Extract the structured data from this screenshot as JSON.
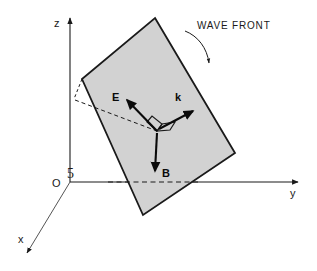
{
  "figure": {
    "kind": "physics-vector-diagram",
    "background_color": "#ffffff",
    "ink_color": "#1a1a1a"
  },
  "axes": {
    "z": {
      "label": "z",
      "direction": "up"
    },
    "y": {
      "label": "y",
      "direction": "right"
    },
    "x": {
      "label": "x",
      "direction": "down-left"
    },
    "origin": {
      "label": "O"
    },
    "angle_marker": {
      "label": "5"
    }
  },
  "plane": {
    "name": "wave front plane",
    "fill_color": "#d2d2d2",
    "stroke_color": "#1a1a1a",
    "corners": "155,18 235,153 143,215 82,79"
  },
  "callout": {
    "label": "WAVE FRONT"
  },
  "vectors": [
    {
      "name": "E",
      "label": "E",
      "direction": "up-left"
    },
    {
      "name": "k",
      "label": "k",
      "direction": "up-right"
    },
    {
      "name": "B",
      "label": "B",
      "direction": "down"
    }
  ],
  "perpendicular_marker": {
    "name": "right-angle-corner",
    "stroke_color": "#1a1a1a"
  }
}
